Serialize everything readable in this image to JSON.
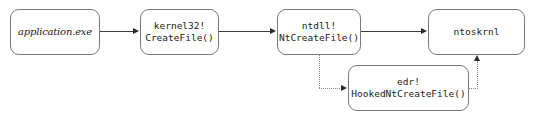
{
  "diagram": {
    "background_color": "#ffffff",
    "nodes": [
      {
        "id": "application",
        "lines": [
          "application.exe"
        ],
        "style": "italic-serif"
      },
      {
        "id": "kernel32",
        "lines": [
          "kernel32!",
          "CreateFile()"
        ],
        "style": "mono"
      },
      {
        "id": "ntdll",
        "lines": [
          "ntdll!",
          "NtCreateFile()"
        ],
        "style": "mono"
      },
      {
        "id": "ntoskrnl",
        "lines": [
          "ntoskrnl"
        ],
        "style": "mono"
      },
      {
        "id": "edr",
        "lines": [
          "edr!",
          "HookedNtCreateFile()"
        ],
        "style": "mono"
      }
    ],
    "edges": [
      {
        "id": "application-to-kernel32",
        "from": "application",
        "to": "kernel32",
        "style": "solid",
        "arrow": "right"
      },
      {
        "id": "kernel32-to-ntdll",
        "from": "kernel32",
        "to": "ntdll",
        "style": "solid",
        "arrow": "right"
      },
      {
        "id": "ntdll-to-ntoskrnl",
        "from": "ntdll",
        "to": "ntoskrnl",
        "style": "solid",
        "arrow": "right"
      },
      {
        "id": "ntdll-to-edr",
        "from": "ntdll",
        "to": "edr",
        "style": "dotted",
        "arrow": "right"
      },
      {
        "id": "edr-to-ntoskrnl",
        "from": "edr",
        "to": "ntoskrnl",
        "style": "dotted",
        "arrow": "up"
      }
    ],
    "colors": {
      "node_border": "#7a7a7a",
      "solid_edge": "#3d3d3d",
      "dotted_edge": "#8d8d8d",
      "text": "#1a1a1a"
    }
  }
}
